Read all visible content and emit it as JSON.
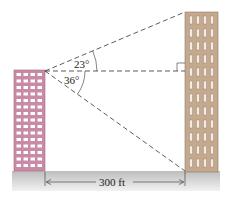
{
  "diagram": {
    "type": "trigonometry-angles-of-elevation-depression",
    "angles": {
      "elevation": "23°",
      "depression": "36°"
    },
    "distance_label": "300 ft",
    "buildings": {
      "left": {
        "color": "#c98aa6",
        "window_color": "#ffffff",
        "window_rows": 15,
        "window_cols": 4
      },
      "right": {
        "color": "#c4a98e",
        "window_color": "#f3ece4",
        "window_rows": 12,
        "window_cols": 4
      }
    },
    "ground_color": "#c9c9c9",
    "line_color": "#333333"
  }
}
